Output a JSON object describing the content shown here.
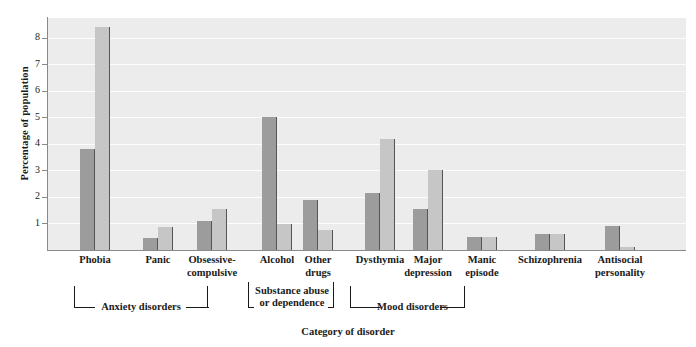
{
  "chart_data": {
    "type": "bar",
    "title": "",
    "xlabel": "Category of disorder",
    "ylabel": "Percentage of population",
    "categories": [
      "Phobia",
      "Panic",
      "Obsessive-\ncompulsive",
      "Alcohol",
      "Other\ndrugs",
      "Dysthymia",
      "Major\ndepression",
      "Manic\nepisode",
      "Schizophrenia",
      "Antisocial\npersonality"
    ],
    "series": [
      {
        "name": "series-dark",
        "color": "#9c9c9c",
        "values": [
          3.8,
          0.45,
          1.1,
          5.0,
          1.9,
          2.15,
          1.55,
          0.5,
          0.6,
          0.9
        ]
      },
      {
        "name": "series-light",
        "color": "#c6c6c6",
        "values": [
          8.4,
          0.85,
          1.55,
          1.0,
          0.75,
          4.2,
          3.0,
          0.5,
          0.6,
          0.1
        ]
      }
    ],
    "ylim": [
      0,
      8.75
    ],
    "yticks": [
      1,
      2,
      3,
      4,
      5,
      6,
      7,
      8
    ],
    "ytick_labels": [
      "1",
      "2",
      "3",
      "4",
      "5",
      "6",
      "7",
      "8"
    ],
    "grid": "horizontal",
    "legend": "none",
    "plot_background": "#ececec",
    "gridline_color": "#fdfdfd",
    "axis_color": "#8a8a8a",
    "group_brackets": [
      {
        "label": "Anxiety disorders",
        "covers": [
          "Phobia",
          "Obsessive-compulsive"
        ]
      },
      {
        "label": "Substance abuse\nor dependence",
        "covers": [
          "Alcohol",
          "Other drugs"
        ]
      },
      {
        "label": "Mood disorders",
        "covers": [
          "Dysthymia",
          "Manic episode"
        ]
      }
    ]
  },
  "axis": {
    "y_title": "Percentage of population",
    "x_title": "Category of disorder"
  },
  "brackets": {
    "anxiety": "Anxiety disorders",
    "substance_line1": "Substance abuse",
    "substance_line2": "or dependence",
    "mood": "Mood disorders"
  },
  "labels": {
    "phobia": "Phobia",
    "panic": "Panic",
    "ocd_line1": "Obsessive-",
    "ocd_line2": "compulsive",
    "alcohol": "Alcohol",
    "otherdrugs_line1": "Other",
    "otherdrugs_line2": "drugs",
    "dysthymia": "Dysthymia",
    "majordep_line1": "Major",
    "majordep_line2": "depression",
    "manic_line1": "Manic",
    "manic_line2": "episode",
    "schizophrenia": "Schizophrenia",
    "antisocial_line1": "Antisocial",
    "antisocial_line2": "personality"
  },
  "yticks": {
    "t1": "1",
    "t2": "2",
    "t3": "3",
    "t4": "4",
    "t5": "5",
    "t6": "6",
    "t7": "7",
    "t8": "8"
  }
}
